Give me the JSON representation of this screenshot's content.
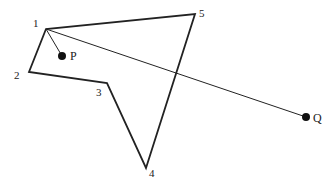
{
  "diagram": {
    "type": "point-in-polygon ray casting",
    "colors": {
      "stroke": "#222222",
      "point": "#111111",
      "background": "#ffffff"
    },
    "polygon": {
      "vertices": [
        {
          "label": "1",
          "x": 46,
          "y": 29,
          "lx": 33,
          "ly": 27
        },
        {
          "label": "2",
          "x": 29,
          "y": 72,
          "lx": 14,
          "ly": 79
        },
        {
          "label": "3",
          "x": 107,
          "y": 83,
          "lx": 96,
          "ly": 96
        },
        {
          "label": "4",
          "x": 146,
          "y": 168,
          "lx": 149,
          "ly": 177
        },
        {
          "label": "5",
          "x": 195,
          "y": 14,
          "lx": 199,
          "ly": 17
        }
      ]
    },
    "points": [
      {
        "label": "P",
        "x": 62,
        "y": 56,
        "lx": 70,
        "ly": 60
      },
      {
        "label": "Q",
        "x": 306,
        "y": 117,
        "lx": 313,
        "ly": 122
      }
    ],
    "segments": [
      {
        "name": "vertex1-to-P",
        "from": [
          46,
          29
        ],
        "to": [
          62,
          56
        ]
      },
      {
        "name": "vertex1-to-Q",
        "from": [
          46,
          29
        ],
        "to": [
          306,
          117
        ]
      }
    ]
  }
}
